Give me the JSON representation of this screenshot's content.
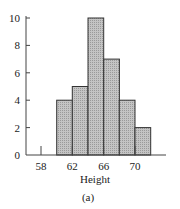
{
  "chart_data": {
    "type": "bar",
    "subtype": "histogram",
    "title": "",
    "xlabel": "Height",
    "ylabel": "",
    "caption": "(a)",
    "bin_edges": [
      60,
      62,
      64,
      66,
      68,
      70,
      72
    ],
    "categories": [
      "60-62",
      "62-64",
      "64-66",
      "66-68",
      "68-70",
      "70-72"
    ],
    "values": [
      4,
      5,
      10,
      7,
      4,
      2
    ],
    "xticks": [
      58,
      62,
      66,
      70
    ],
    "yticks": [
      0,
      2,
      4,
      6,
      8,
      10
    ],
    "xlim": [
      56,
      76
    ],
    "ylim": [
      0,
      10
    ],
    "grid": false,
    "legend": null,
    "bar_fill": "#b8b8b8",
    "bar_edge": "#333333"
  },
  "labels": {
    "xlabel": "Height",
    "caption": "(a)",
    "xticks": [
      "58",
      "62",
      "66",
      "70"
    ],
    "yticks": [
      "0",
      "2",
      "4",
      "6",
      "8",
      "10"
    ]
  }
}
